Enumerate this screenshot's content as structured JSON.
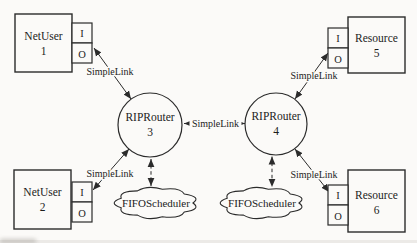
{
  "nodes": {
    "netuser1": {
      "title": "NetUser",
      "number": "1"
    },
    "netuser2": {
      "title": "NetUser",
      "number": "2"
    },
    "resource5": {
      "title": "Resource",
      "number": "5"
    },
    "resource6": {
      "title": "Resource",
      "number": "6"
    },
    "router3": {
      "title": "RIPRouter",
      "number": "3"
    },
    "router4": {
      "title": "RIPRouter",
      "number": "4"
    }
  },
  "schedulers": {
    "left": {
      "label": "FIFOScheduler"
    },
    "right": {
      "label": "FIFOScheduler"
    }
  },
  "ports": {
    "input": "I",
    "output": "O"
  },
  "links": {
    "label": "SimpleLink"
  },
  "colors": {
    "line": "#2b2b2b",
    "text": "#1c1c1c",
    "background": "#fbfaf8"
  }
}
